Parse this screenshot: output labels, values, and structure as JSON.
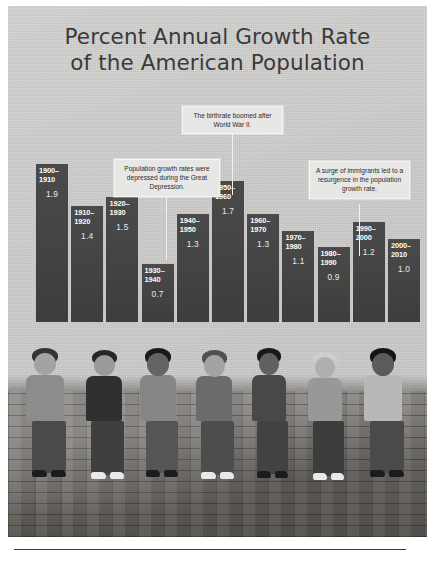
{
  "title": {
    "line1": "Percent Annual Growth Rate",
    "line2": "of the American Population"
  },
  "callouts": {
    "world_war_ii": "The birthrate boomed after World War II.",
    "great_depression": "Population growth rates were depressed during the Great Depression.",
    "immigration": "A surge of immigrants led to a resurgence in the population growth rate."
  },
  "colors": {
    "background": "#d0cfcd",
    "bar": "#434343",
    "bar_label_text": "#ffffff",
    "callout_background": "#e7e7e5",
    "title_text": "#3a3a3a",
    "footer_rule": "#3c3c3c"
  },
  "chart_data": {
    "type": "bar",
    "title": "Percent Annual Growth Rate of the American Population",
    "xlabel": "",
    "ylabel": "Percent Annual Growth Rate",
    "ylim": [
      0,
      2.0
    ],
    "grid": false,
    "legend": "none",
    "categories": [
      "1900–1910",
      "1910–1920",
      "1920–1930",
      "1930–1940",
      "1940–1950",
      "1950–1960",
      "1960–1970",
      "1970–1980",
      "1980–1990",
      "1990–2000",
      "2000–2010"
    ],
    "values": [
      1.9,
      1.4,
      1.5,
      0.7,
      1.3,
      1.7,
      1.3,
      1.1,
      0.9,
      1.2,
      1.0
    ],
    "value_labels": [
      "1.9",
      "1.4",
      "1.5",
      "0.7",
      "1.3",
      "1.7",
      "1.3",
      "1.1",
      "0.9",
      "1.2",
      "1.0"
    ],
    "annotations": [
      {
        "text": "The birthrate boomed after World War II.",
        "target_category": "1950–1960"
      },
      {
        "text": "Population growth rates were depressed during the Great Depression.",
        "target_category": "1930–1940"
      },
      {
        "text": "A surge of immigrants led to a resurgence in the population growth rate.",
        "target_category": "1990–2000"
      }
    ]
  },
  "photo": {
    "description": "Group of young people sitting on a brick wall"
  }
}
